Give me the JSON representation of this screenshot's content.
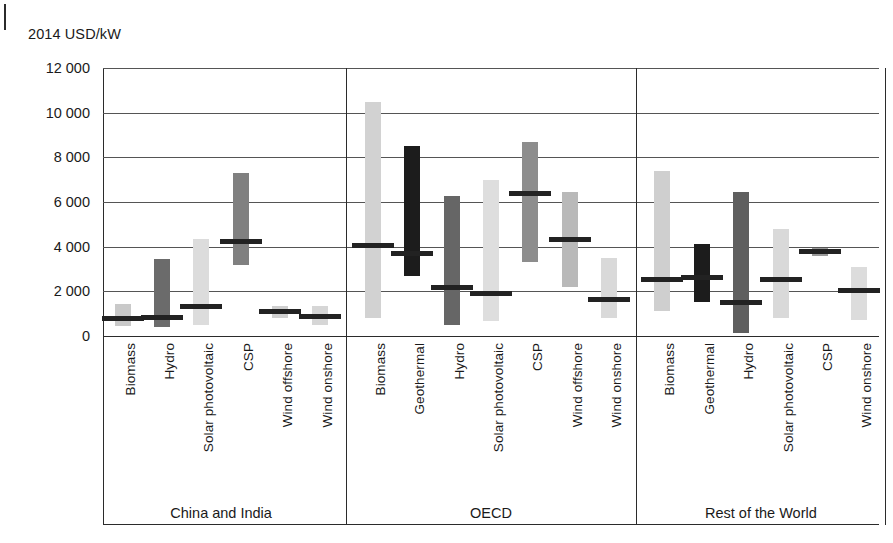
{
  "chart_data": {
    "type": "bar",
    "title": "",
    "subtitle": "",
    "ylabel": "2014 USD/kW",
    "xlabel": "",
    "ylim": [
      0,
      12000
    ],
    "ytick_step": 2000,
    "yticks": [
      "0",
      "2 000",
      "4 000",
      "6 000",
      "8 000",
      "10 000",
      "12 000"
    ],
    "grid": true,
    "legend": "none",
    "note": "Floating range bars (min-max) with a median marker line, grouped by region.",
    "value_encoding": [
      "low",
      "high",
      "median"
    ],
    "groups": [
      {
        "name": "China and India",
        "categories": [
          "Biomass",
          "Hydro",
          "Solar photovoltaic",
          "CSP",
          "Wind offshore",
          "Wind onshore"
        ],
        "bars": [
          {
            "label": "Biomass",
            "low": 450,
            "high": 1450,
            "median": 800,
            "color": "#c9c9c9"
          },
          {
            "label": "Hydro",
            "low": 400,
            "high": 3450,
            "median": 850,
            "color": "#6b6b6b"
          },
          {
            "label": "Solar photovoltaic",
            "low": 500,
            "high": 4350,
            "median": 1300,
            "color": "#dcdcdc"
          },
          {
            "label": "CSP",
            "low": 3200,
            "high": 7300,
            "median": 4250,
            "color": "#808080"
          },
          {
            "label": "Wind offshore",
            "low": 800,
            "high": 1350,
            "median": 1100,
            "color": "#cfcfcf"
          },
          {
            "label": "Wind onshore",
            "low": 500,
            "high": 1350,
            "median": 880,
            "color": "#d6d6d6"
          }
        ]
      },
      {
        "name": "OECD",
        "categories": [
          "Biomass",
          "Geothermal",
          "Hydro",
          "Solar photovoltaic",
          "CSP",
          "Wind offshore",
          "Wind onshore"
        ],
        "bars": [
          {
            "label": "Biomass",
            "low": 800,
            "high": 10500,
            "median": 4050,
            "color": "#d2d2d2"
          },
          {
            "label": "Geothermal",
            "low": 2700,
            "high": 8500,
            "median": 3700,
            "color": "#1c1c1c"
          },
          {
            "label": "Hydro",
            "low": 500,
            "high": 6250,
            "median": 2150,
            "color": "#666666"
          },
          {
            "label": "Solar photovoltaic",
            "low": 650,
            "high": 7000,
            "median": 1900,
            "color": "#dedede"
          },
          {
            "label": "CSP",
            "low": 3300,
            "high": 8700,
            "median": 6400,
            "color": "#8d8d8d"
          },
          {
            "label": "Wind offshore",
            "low": 2200,
            "high": 6450,
            "median": 4300,
            "color": "#b9b9b9"
          },
          {
            "label": "Wind onshore",
            "low": 800,
            "high": 3500,
            "median": 1650,
            "color": "#d9d9d9"
          }
        ]
      },
      {
        "name": "Rest of the World",
        "categories": [
          "Biomass",
          "Geothermal",
          "Hydro",
          "Solar photovoltaic",
          "CSP",
          "Wind onshore"
        ],
        "bars": [
          {
            "label": "Biomass",
            "low": 1100,
            "high": 7400,
            "median": 2550,
            "color": "#cfcfcf"
          },
          {
            "label": "Geothermal",
            "low": 1500,
            "high": 4100,
            "median": 2600,
            "color": "#1c1c1c"
          },
          {
            "label": "Hydro",
            "low": 150,
            "high": 6450,
            "median": 1500,
            "color": "#5f5f5f"
          },
          {
            "label": "Solar photovoltaic",
            "low": 800,
            "high": 4800,
            "median": 2550,
            "color": "#d9d9d9"
          },
          {
            "label": "CSP",
            "low": 3600,
            "high": 3950,
            "median": 3800,
            "color": "#9a9a9a"
          },
          {
            "label": "Wind onshore",
            "low": 700,
            "high": 3100,
            "median": 2050,
            "color": "#dcdcdc"
          }
        ]
      }
    ]
  }
}
